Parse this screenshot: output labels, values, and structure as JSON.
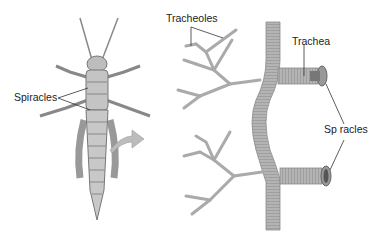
{
  "diagram": {
    "left_panel": {
      "subject": "grasshopper-ventral-view",
      "labels": {
        "spiracles": "Spiracles"
      }
    },
    "right_panel": {
      "subject": "tracheal-system-detail",
      "labels": {
        "tracheoles": "Tracheoles",
        "trachea": "Trachea",
        "spiracles": "Sp racles"
      }
    },
    "colors": {
      "tube": "#a9a9a9",
      "tube_dark": "#6f6f6f",
      "arrow": "#b8b8b8",
      "text": "#222222",
      "leader": "#333333"
    }
  }
}
